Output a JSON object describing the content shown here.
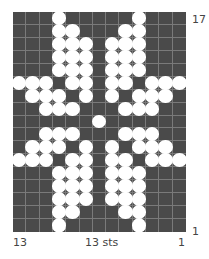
{
  "chart_data": {
    "type": "knitting-colorwork-chart",
    "columns": 13,
    "rows": 17,
    "background_color": "#4a4a4a",
    "contrast_color": "#ffffff",
    "grid_line_color": "#7a7a7a",
    "row_labels": {
      "top": "17",
      "bottom": "1"
    },
    "column_labels": {
      "left": "13",
      "center": "13 sts",
      "right": "1"
    },
    "pattern_top_to_bottom": [
      "0001000001000",
      "0001100011000",
      "0001110111000",
      "0001110111000",
      "0001110111000",
      "1110110110111",
      "0111010101110",
      "0011100011100",
      "0000001000000",
      "0011100011100",
      "0111010101110",
      "1110110110111",
      "0001110111000",
      "0001110111000",
      "0001110111000",
      "0001100011000",
      "0001000001000"
    ]
  },
  "labels": {
    "row_top": "17",
    "row_bottom": "1",
    "col_left": "13",
    "col_center": "13 sts",
    "col_right": "1"
  }
}
